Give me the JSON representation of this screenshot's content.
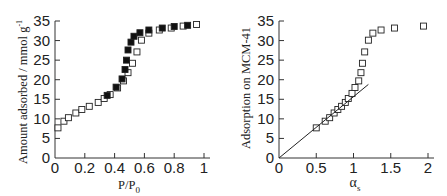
{
  "chart_data": [
    {
      "type": "scatter",
      "title": "",
      "xlabel": "P/P0",
      "ylabel": "Amount adsorbed / mmol g-1",
      "xlim": [
        0,
        1
      ],
      "ylim": [
        0,
        35
      ],
      "xticks": [
        "0",
        "0.2",
        "0.4",
        "0.6",
        "0.8",
        "1"
      ],
      "yticks": [
        "0",
        "5",
        "10",
        "15",
        "20",
        "25",
        "30",
        "35"
      ],
      "grid": false,
      "legend": "none",
      "series": [
        {
          "name": "adsorption",
          "marker": "open-square",
          "x": [
            0.02,
            0.06,
            0.09,
            0.14,
            0.18,
            0.23,
            0.29,
            0.33,
            0.37,
            0.42,
            0.46,
            0.49,
            0.52,
            0.55,
            0.58,
            0.63,
            0.7,
            0.78,
            0.86,
            0.95
          ],
          "y": [
            7.7,
            9.4,
            10.3,
            11.5,
            12.4,
            13.2,
            14.2,
            15.2,
            16.2,
            17.9,
            19.7,
            21.8,
            24.2,
            27.1,
            30.1,
            31.9,
            32.7,
            33.2,
            33.7,
            34.1
          ]
        },
        {
          "name": "desorption",
          "marker": "filled-square",
          "x": [
            0.35,
            0.41,
            0.45,
            0.47,
            0.48,
            0.49,
            0.51,
            0.53,
            0.57,
            0.63,
            0.72,
            0.8,
            0.89
          ],
          "y": [
            16.0,
            18.1,
            20.2,
            22.6,
            25.0,
            27.6,
            29.6,
            31.1,
            32.0,
            32.7,
            33.2,
            33.6,
            33.9
          ]
        }
      ]
    },
    {
      "type": "scatter",
      "title": "",
      "xlabel": "αs",
      "ylabel": "Adsorption on MCM-41",
      "xlim": [
        0,
        2
      ],
      "ylim": [
        0,
        35
      ],
      "xticks": [
        "0",
        "0.5",
        "1",
        "1.5",
        "2"
      ],
      "yticks": [
        "0",
        "5",
        "10",
        "15",
        "20",
        "25",
        "30",
        "35"
      ],
      "grid": false,
      "legend": "none",
      "series": [
        {
          "name": "alpha-s plot",
          "marker": "open-square",
          "x": [
            0.5,
            0.62,
            0.68,
            0.74,
            0.79,
            0.84,
            0.89,
            0.93,
            0.98,
            1.02,
            1.07,
            1.1,
            1.12,
            1.15,
            1.2,
            1.26,
            1.37,
            1.55,
            1.94
          ],
          "y": [
            7.7,
            9.4,
            10.3,
            11.5,
            12.4,
            13.2,
            14.2,
            15.2,
            16.5,
            18.0,
            19.7,
            21.8,
            24.2,
            27.1,
            30.1,
            31.9,
            32.7,
            33.2,
            33.7
          ]
        },
        {
          "name": "linear fit",
          "marker": "line",
          "x": [
            0,
            1.2
          ],
          "y": [
            0,
            18.8
          ]
        }
      ]
    }
  ],
  "labels": {
    "left_ylabel": "Amount adsorbed / mmol g",
    "left_ylabel_sup": "-1",
    "left_xlabel": "P/P",
    "left_xlabel_sub": "0",
    "right_ylabel": "Adsorption on MCM-41",
    "right_xlabel": "α",
    "right_xlabel_sub": "s"
  }
}
